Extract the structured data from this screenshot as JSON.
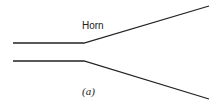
{
  "diagram": {
    "label": "Horn",
    "caption": "(a)",
    "stroke_color": "#222222",
    "upper_line": {
      "x1": 13,
      "y1": 43,
      "xb": 84,
      "yb": 43,
      "x2": 209,
      "y2": 6
    },
    "lower_line": {
      "x1": 13,
      "y1": 61,
      "xb": 84,
      "yb": 61,
      "x2": 209,
      "y2": 99
    }
  }
}
